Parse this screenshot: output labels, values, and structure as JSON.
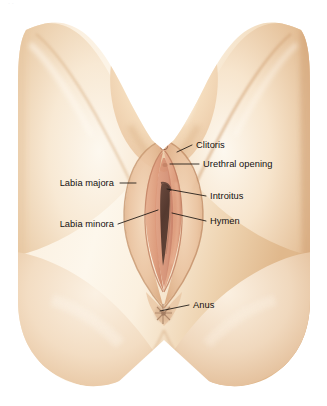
{
  "figure": {
    "view": "frontal perineal view",
    "background_color": "#ffffff",
    "width": 327,
    "height": 406
  },
  "palette": {
    "background": "#ffffff",
    "skin_highlight": "#fdf6ea",
    "skin_light": "#fbeedd",
    "skin_mid": "#f0d4b2",
    "skin_tan": "#e5c19a",
    "skin_deep": "#d8ab82",
    "mons_peach": "#f5dcba",
    "labia_pink": "#e0a88c",
    "labia_inner": "#d9967c",
    "introitus_dark": "#5a4038",
    "crease_shadow": "#c79a76",
    "text": "#141110",
    "leader": "#1a1512"
  },
  "labels": [
    {
      "id": "clitoris",
      "text": "Clitoris",
      "side": "right",
      "text_x": 196,
      "text_y": 148,
      "leader": "M 192 145 L 177 152"
    },
    {
      "id": "urethral-opening",
      "text": "Urethral opening",
      "side": "right",
      "text_x": 203,
      "text_y": 167,
      "leader": "M 199 164 L 170 164"
    },
    {
      "id": "introitus",
      "text": "Introitus",
      "side": "right",
      "text_x": 210,
      "text_y": 199,
      "leader": "M 206 196 L 167 189"
    },
    {
      "id": "hymen",
      "text": "Hymen",
      "side": "right",
      "text_x": 210,
      "text_y": 224,
      "leader": "M 206 221 L 172 213"
    },
    {
      "id": "anus",
      "text": "Anus",
      "side": "right",
      "text_x": 193,
      "text_y": 308,
      "leader": "M 189 305 L 160 311"
    },
    {
      "id": "labia-majora",
      "text": "Labia majora",
      "side": "left",
      "text_x": 114,
      "text_y": 186,
      "leader": "M 120 183 L 135 183"
    },
    {
      "id": "labia-minora",
      "text": "Labia minora",
      "side": "left",
      "text_x": 114,
      "text_y": 227,
      "leader": "M 118 224 L 158 210"
    }
  ],
  "anatomy_parts": [
    {
      "id": "left-thigh",
      "name": "left inner thigh"
    },
    {
      "id": "right-thigh",
      "name": "right inner thigh"
    },
    {
      "id": "mons-pubis",
      "name": "mons pubis"
    },
    {
      "id": "labia-majora-shape",
      "name": "labia majora"
    },
    {
      "id": "labia-minora-shape",
      "name": "labia minora"
    },
    {
      "id": "clitoris-shape",
      "name": "clitoris"
    },
    {
      "id": "urethral-opening-shape",
      "name": "urethral opening"
    },
    {
      "id": "introitus-shape",
      "name": "vaginal introitus"
    },
    {
      "id": "perineum",
      "name": "perineum"
    },
    {
      "id": "anus-shape",
      "name": "anus"
    },
    {
      "id": "buttocks",
      "name": "buttocks"
    }
  ],
  "top_artifact": {
    "text": "·  ·"
  }
}
